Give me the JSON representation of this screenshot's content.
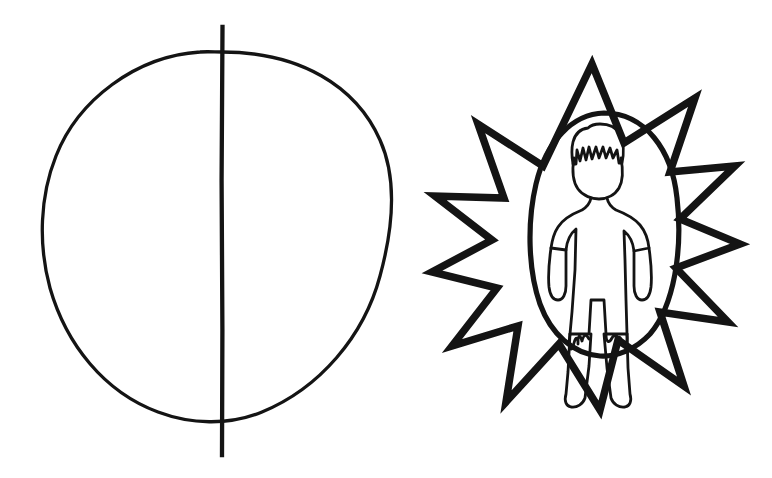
{
  "page": {
    "background_color": "#ffffff",
    "ink_color": "#141414",
    "width": 772,
    "height": 478
  },
  "figures": [
    {
      "id": "divided-circle",
      "name": "Circle bisected by a vertical line",
      "description": "A large hand-drawn circle with a straight vertical line running through its center and extending past the top and bottom of the circle.",
      "stroke_color": "#141414",
      "fill": "none",
      "geometry": {
        "circle": {
          "cx": 216,
          "cy": 237,
          "rx": 172,
          "ry": 185,
          "stroke_width": 3.2
        },
        "vertical_line": {
          "x": 222,
          "y_top": 27,
          "y_bottom": 455,
          "stroke_width": 4.2
        }
      }
    },
    {
      "id": "starburst-with-person",
      "name": "Twelve-pointed starburst enclosing an oval with a standing person",
      "description": "A thick hand-drawn twelve-pointed star; inside it an oval outline frames a simple standing human figure with short hair, arms at the sides and legs apart.",
      "stroke_color": "#141414",
      "fill": "none",
      "geometry": {
        "star": {
          "cx": 606,
          "cy": 237,
          "outer_rx": 129,
          "outer_ry": 173,
          "inner_rx": 76,
          "inner_ry": 102,
          "points": 12,
          "stroke_width": 7
        },
        "oval": {
          "cx": 604,
          "cy": 234,
          "rx": 74,
          "ry": 121,
          "stroke_width": 5
        },
        "person": {
          "height_px": 218,
          "top_y": 126,
          "bottom_y": 344,
          "stroke_width": 2.6
        }
      }
    }
  ],
  "labels": {
    "circle_figure_label": "",
    "star_figure_label": ""
  }
}
